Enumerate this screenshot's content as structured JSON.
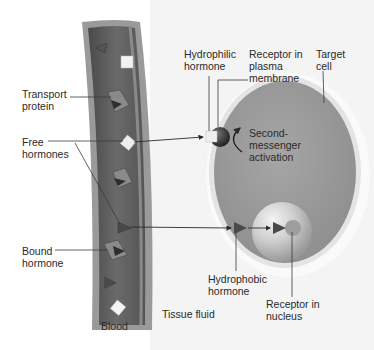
{
  "diagram": {
    "colors": {
      "vessel_wall": "#8a8a8a",
      "vessel_lumen": "#5e5e5e",
      "cell_cytoplasm": "#9a9a9a",
      "cell_membrane": "#e6e6e6",
      "nucleus": "#c4c4c4",
      "hormone_square": "#f0f0f0",
      "hormone_triangle": "#4a4a4a",
      "leader_line": "#3a3a3a"
    },
    "labels": {
      "transport_protein": "Transport\nprotein",
      "free_hormones": "Free\nhormones",
      "bound_hormone": "Bound\nhormone",
      "blood": "Blood",
      "tissue_fluid": "Tissue fluid",
      "hydrophilic_hormone": "Hydrophilic\nhormone",
      "receptor_plasma_membrane": "Receptor in\nplasma\nmembrane",
      "target_cell": "Target\ncell",
      "second_messenger": "Second-\nmessenger\nactivation",
      "hydrophobic_hormone": "Hydrophobic\nhormone",
      "receptor_nucleus": "Receptor in\nnucleus"
    }
  }
}
